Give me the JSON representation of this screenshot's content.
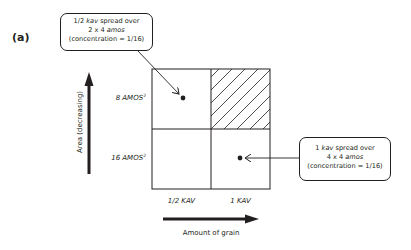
{
  "panel": {
    "label": "(a)"
  },
  "grid": {
    "rows": [
      {
        "label": "8 AMOS",
        "sup": "2"
      },
      {
        "label": "16 AMOS",
        "sup": "2"
      }
    ],
    "columns": [
      {
        "label": "1/2 KAV"
      },
      {
        "label": "1 KAV"
      }
    ],
    "hatched_cell": "top-right"
  },
  "axes": {
    "y_label": "Area (decreasing)",
    "x_label": "Amount of grain"
  },
  "callouts": [
    {
      "line1_pre": "1/2 ",
      "line1_em": "kav",
      "line1_post": " spread over",
      "line2_pre": "2 x 4 ",
      "line2_em": "amos",
      "line3": "(concentration = 1/16)"
    },
    {
      "line1_pre": "1 ",
      "line1_em": "kav",
      "line1_post": " spread over",
      "line2_pre": "4 x 4 ",
      "line2_em": "amos",
      "line3": "(concentration = 1/16)"
    }
  ],
  "colors": {
    "ink": "#231f20",
    "background": "#ffffff"
  }
}
